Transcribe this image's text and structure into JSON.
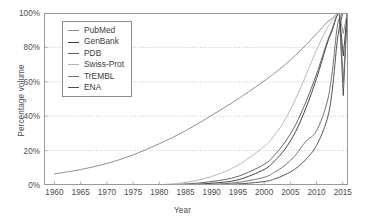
{
  "chart_data": {
    "type": "line",
    "title": "",
    "xlabel": "Year",
    "ylabel": "Percentage volume",
    "xlim": [
      1958,
      2016
    ],
    "ylim": [
      0,
      100
    ],
    "grid": true,
    "legend_position": "top-left",
    "x_ticks": [
      "1960",
      "1965",
      "1970",
      "1975",
      "1980",
      "1985",
      "1990",
      "1995",
      "2000",
      "2005",
      "2010",
      "2015"
    ],
    "x_tick_values": [
      1960,
      1965,
      1970,
      1975,
      1980,
      1985,
      1990,
      1995,
      2000,
      2005,
      2010,
      2015
    ],
    "y_ticks": [
      "0%",
      "20%",
      "40%",
      "60%",
      "80%",
      "100%"
    ],
    "y_tick_values": [
      0,
      20,
      40,
      60,
      80,
      100
    ],
    "x": [
      1960,
      1965,
      1970,
      1975,
      1980,
      1985,
      1990,
      1995,
      2000,
      2002,
      2004,
      2006,
      2008,
      2010,
      2012,
      2013,
      2014,
      2015
    ],
    "series": [
      {
        "name": "PubMed",
        "color": "#8a8a8a",
        "values": [
          6.5,
          9.0,
          12.5,
          17.5,
          24.0,
          31.5,
          40.5,
          50.0,
          60.5,
          65.0,
          70.0,
          75.5,
          81.5,
          88.0,
          94.5,
          97.0,
          99.5,
          100.0
        ]
      },
      {
        "name": "GenBank",
        "color": "#3a3a3a",
        "values": [
          0.0,
          0.0,
          0.0,
          0.0,
          0.0,
          0.2,
          1.0,
          3.0,
          9.0,
          14.0,
          21.0,
          31.0,
          45.0,
          62.0,
          82.0,
          90.0,
          99.0,
          100.0
        ]
      },
      {
        "name": "PDB",
        "color": "#5e5e5e",
        "values": [
          0.0,
          0.0,
          0.0,
          0.0,
          0.1,
          0.6,
          2.0,
          5.0,
          12.0,
          17.5,
          25.0,
          35.0,
          48.5,
          64.5,
          83.0,
          91.0,
          99.0,
          100.0
        ]
      },
      {
        "name": "Swiss-Prot",
        "color": "#b5b5b5",
        "values": [
          0.0,
          0.0,
          0.0,
          0.0,
          0.2,
          1.5,
          5.0,
          11.5,
          22.5,
          29.0,
          38.0,
          50.0,
          64.0,
          78.5,
          91.0,
          95.5,
          99.5,
          100.0
        ]
      },
      {
        "name": "TrEMBL",
        "color": "#6e6e6e",
        "values": [
          0.0,
          0.0,
          0.0,
          0.0,
          0.0,
          0.0,
          0.4,
          1.5,
          4.5,
          7.5,
          11.5,
          17.5,
          25.5,
          31.5,
          48.0,
          66.0,
          93.0,
          100.0
        ]
      },
      {
        "name": "ENA",
        "color": "#4a4a4a",
        "values": [
          0.0,
          0.0,
          0.0,
          0.0,
          0.0,
          0.0,
          0.1,
          0.6,
          2.0,
          3.5,
          6.0,
          9.5,
          15.0,
          23.0,
          38.0,
          55.0,
          85.0,
          100.0
        ]
      }
    ]
  },
  "legend": {
    "items": [
      {
        "label": "PubMed"
      },
      {
        "label": "GenBank"
      },
      {
        "label": "PDB"
      },
      {
        "label": "Swiss-Prot"
      },
      {
        "label": "TrEMBL"
      },
      {
        "label": "ENA"
      }
    ]
  }
}
